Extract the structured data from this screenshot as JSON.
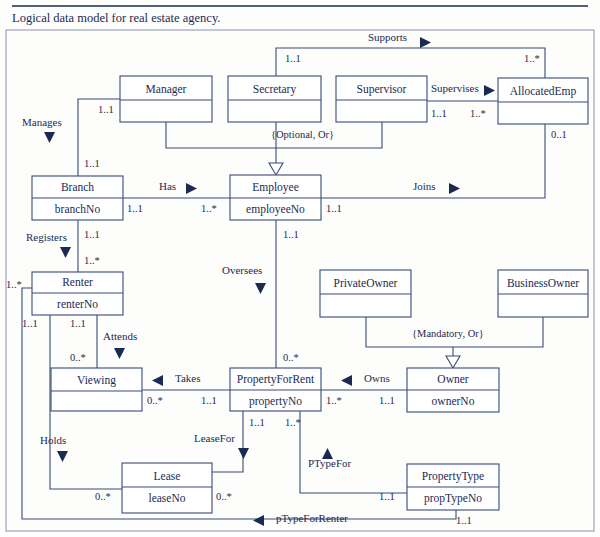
{
  "title": "Logical data model for real estate agency.",
  "entities": [
    {
      "id": "manager",
      "name": "Manager",
      "attr": "",
      "x": 120,
      "y": 76,
      "w": 92,
      "h": 46,
      "div": 100
    },
    {
      "id": "secretary",
      "name": "Secretary",
      "attr": "",
      "x": 228,
      "y": 76,
      "w": 93,
      "h": 46,
      "div": 100
    },
    {
      "id": "supervisor",
      "name": "Supervisor",
      "attr": "",
      "x": 336,
      "y": 76,
      "w": 91,
      "h": 46,
      "div": 100
    },
    {
      "id": "allocatedemp",
      "name": "AllocatedEmp",
      "attr": "",
      "x": 498,
      "y": 78,
      "w": 90,
      "h": 46,
      "div": 102
    },
    {
      "id": "branch",
      "name": "Branch",
      "attr": "branchNo",
      "x": 32,
      "y": 176,
      "w": 91,
      "h": 44,
      "div": 198
    },
    {
      "id": "employee",
      "name": "Employee",
      "attr": "employeeNo",
      "x": 230,
      "y": 175,
      "w": 91,
      "h": 45,
      "div": 198
    },
    {
      "id": "renter",
      "name": "Renter",
      "attr": "renterNo",
      "x": 32,
      "y": 272,
      "w": 91,
      "h": 43,
      "div": 293
    },
    {
      "id": "privateowner",
      "name": "PrivateOwner",
      "attr": "",
      "x": 320,
      "y": 270,
      "w": 91,
      "h": 47,
      "div": 294
    },
    {
      "id": "businessowner",
      "name": "BusinessOwner",
      "attr": "",
      "x": 498,
      "y": 270,
      "w": 90,
      "h": 47,
      "div": 294
    },
    {
      "id": "viewing",
      "name": "Viewing",
      "attr": "",
      "x": 51,
      "y": 368,
      "w": 91,
      "h": 43,
      "div": 391
    },
    {
      "id": "propertyforrent",
      "name": "PropertyForRent",
      "attr": "propertyNo",
      "x": 230,
      "y": 368,
      "w": 91,
      "h": 43,
      "div": 390
    },
    {
      "id": "owner",
      "name": "Owner",
      "attr": "ownerNo",
      "x": 407,
      "y": 368,
      "w": 92,
      "h": 44,
      "div": 390
    },
    {
      "id": "lease",
      "name": "Lease",
      "attr": "leaseNo",
      "x": 122,
      "y": 463,
      "w": 90,
      "h": 50,
      "div": 487
    },
    {
      "id": "propertytype",
      "name": "PropertyType",
      "attr": "propTypeNo",
      "x": 407,
      "y": 464,
      "w": 92,
      "h": 46,
      "div": 487
    }
  ],
  "relationships": [
    {
      "id": "supports",
      "label": "Supports",
      "x": 368,
      "y": 41,
      "dir": "right",
      "ax": 420,
      "ay": 37
    },
    {
      "id": "supervises",
      "label": "Supervises",
      "x": 431,
      "y": 92,
      "dir": "right",
      "ax": 484,
      "ay": 85
    },
    {
      "id": "manages",
      "label": "Manages",
      "x": 22,
      "y": 126,
      "dir": "down",
      "ax": 44,
      "ay": 132
    },
    {
      "id": "has",
      "label": "Has",
      "x": 159,
      "y": 190,
      "dir": "right",
      "ax": 186,
      "ay": 183
    },
    {
      "id": "joins",
      "label": "Joins",
      "x": 413,
      "y": 190,
      "dir": "right",
      "ax": 449,
      "ay": 183
    },
    {
      "id": "registers",
      "label": "Registers",
      "x": 26,
      "y": 241,
      "dir": "down",
      "ax": 60,
      "ay": 247
    },
    {
      "id": "oversees",
      "label": "Oversees",
      "x": 222,
      "y": 274,
      "dir": "down",
      "ax": 255,
      "ay": 283
    },
    {
      "id": "attends",
      "label": "Attends",
      "x": 103,
      "y": 340,
      "dir": "down",
      "ax": 114,
      "ay": 348
    },
    {
      "id": "takes",
      "label": "Takes",
      "x": 175,
      "y": 382,
      "dir": "left",
      "ax": 163,
      "ay": 375
    },
    {
      "id": "owns",
      "label": "Owns",
      "x": 364,
      "y": 382,
      "dir": "left",
      "ax": 352,
      "ay": 375
    },
    {
      "id": "holds",
      "label": "Holds",
      "x": 40,
      "y": 444,
      "dir": "down",
      "ax": 57,
      "ay": 451
    },
    {
      "id": "leasefor",
      "label": "LeaseFor",
      "x": 194,
      "y": 442,
      "dir": "down",
      "ax": 238,
      "ay": 448
    },
    {
      "id": "ptypefor",
      "label": "PTypeFor",
      "x": 308,
      "y": 467,
      "dir": "up",
      "ax": 322,
      "ay": 448
    },
    {
      "id": "ptypeforrenter",
      "label": "pTypeForRenter",
      "x": 276,
      "y": 522,
      "dir": "left",
      "ax": 264,
      "ay": 515
    }
  ],
  "constraints": [
    {
      "id": "optional-or",
      "label": "{Optional, Or}",
      "x": 271,
      "y": 138
    },
    {
      "id": "mandatory-or",
      "label": "{Mandatory, Or}",
      "x": 412,
      "y": 337
    }
  ],
  "multiplicities": [
    {
      "id": "m-supports-sec",
      "value": "1..1",
      "x": 285,
      "y": 62
    },
    {
      "id": "m-supports-alloc",
      "value": "1..*",
      "x": 524,
      "y": 62
    },
    {
      "id": "m-manages-mgr",
      "value": "1..1",
      "x": 98,
      "y": 113
    },
    {
      "id": "m-supervises-sup",
      "value": "1..1",
      "x": 431,
      "y": 117
    },
    {
      "id": "m-supervises-alloc",
      "value": "1..*",
      "x": 470,
      "y": 117
    },
    {
      "id": "m-joins-alloc",
      "value": "0..1",
      "x": 551,
      "y": 138
    },
    {
      "id": "m-manages-branch",
      "value": "1..1",
      "x": 84,
      "y": 167
    },
    {
      "id": "m-has-branch",
      "value": "1..1",
      "x": 127,
      "y": 212
    },
    {
      "id": "m-has-emp",
      "value": "1..*",
      "x": 201,
      "y": 212
    },
    {
      "id": "m-joins-emp",
      "value": "1..1",
      "x": 326,
      "y": 212
    },
    {
      "id": "m-registers-branch",
      "value": "1..1",
      "x": 84,
      "y": 238
    },
    {
      "id": "m-oversees-emp",
      "value": "1..1",
      "x": 283,
      "y": 238
    },
    {
      "id": "m-registers-renter",
      "value": "1..*",
      "x": 84,
      "y": 264
    },
    {
      "id": "m-ptyperenter-renter",
      "value": "1..*",
      "x": 6,
      "y": 288
    },
    {
      "id": "m-holds-renter",
      "value": "1..1",
      "x": 22,
      "y": 327
    },
    {
      "id": "m-attends-renter",
      "value": "1..1",
      "x": 70,
      "y": 327
    },
    {
      "id": "m-attends-viewing",
      "value": "0..*",
      "x": 70,
      "y": 361
    },
    {
      "id": "m-oversees-pfr",
      "value": "0..*",
      "x": 283,
      "y": 361
    },
    {
      "id": "m-takes-viewing",
      "value": "0..*",
      "x": 147,
      "y": 404
    },
    {
      "id": "m-takes-pfr",
      "value": "1..1",
      "x": 201,
      "y": 404
    },
    {
      "id": "m-owns-pfr",
      "value": "1..*",
      "x": 326,
      "y": 404
    },
    {
      "id": "m-owns-owner",
      "value": "1..1",
      "x": 379,
      "y": 404
    },
    {
      "id": "m-leasefor-pfr",
      "value": "1..1",
      "x": 249,
      "y": 426
    },
    {
      "id": "m-ptypefor-pfr",
      "value": "1..*",
      "x": 285,
      "y": 426
    },
    {
      "id": "m-holds-lease",
      "value": "0..*",
      "x": 95,
      "y": 500
    },
    {
      "id": "m-leasefor-lease",
      "value": "0..*",
      "x": 216,
      "y": 500
    },
    {
      "id": "m-ptypefor-ptype",
      "value": "1..1",
      "x": 379,
      "y": 500
    },
    {
      "id": "m-ptyperenter-ptype",
      "value": "1..1",
      "x": 456,
      "y": 524
    }
  ],
  "colors": {
    "ink": "#1b2a52",
    "line": "#3a4a78",
    "paper": "#fdfdfb",
    "frame": "#9aa4bd"
  }
}
